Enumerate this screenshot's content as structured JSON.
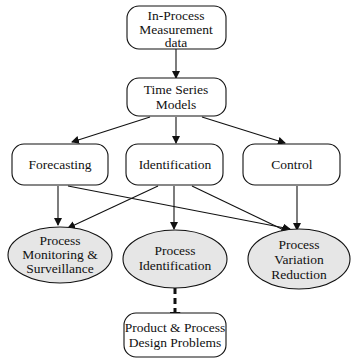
{
  "diagram": {
    "nodes": {
      "measurement": {
        "lines": [
          "In-Process",
          "Measurement",
          "data"
        ],
        "shape": "rounded-rect"
      },
      "tsmodels": {
        "lines": [
          "Time Series",
          "Models"
        ],
        "shape": "rounded-rect"
      },
      "forecasting": {
        "lines": [
          "Forecasting"
        ],
        "shape": "rounded-rect"
      },
      "identification": {
        "lines": [
          "Identification"
        ],
        "shape": "rounded-rect"
      },
      "control": {
        "lines": [
          "Control"
        ],
        "shape": "rounded-rect"
      },
      "monitoring": {
        "lines": [
          "Process",
          "Monitoring &",
          "Surveillance"
        ],
        "shape": "ellipse"
      },
      "procident": {
        "lines": [
          "Process",
          "Identification"
        ],
        "shape": "ellipse"
      },
      "variation": {
        "lines": [
          "Process",
          "Variation",
          "Reduction"
        ],
        "shape": "ellipse"
      },
      "design": {
        "lines": [
          "Product & Process",
          "Design Problems"
        ],
        "shape": "rounded-rect"
      }
    },
    "edges": [
      {
        "from": "measurement",
        "to": "tsmodels",
        "style": "solid"
      },
      {
        "from": "tsmodels",
        "to": "forecasting",
        "style": "solid"
      },
      {
        "from": "tsmodels",
        "to": "identification",
        "style": "solid"
      },
      {
        "from": "tsmodels",
        "to": "control",
        "style": "solid"
      },
      {
        "from": "forecasting",
        "to": "monitoring",
        "style": "solid"
      },
      {
        "from": "forecasting",
        "to": "variation",
        "style": "solid"
      },
      {
        "from": "identification",
        "to": "monitoring",
        "style": "solid"
      },
      {
        "from": "identification",
        "to": "procident",
        "style": "solid"
      },
      {
        "from": "identification",
        "to": "variation",
        "style": "solid"
      },
      {
        "from": "control",
        "to": "variation",
        "style": "solid"
      },
      {
        "from": "procident",
        "to": "design",
        "style": "dashed-bold"
      }
    ],
    "colors": {
      "stroke": "#111111",
      "ellipse_fill": "#e6e6e6",
      "box_fill": "#ffffff"
    }
  }
}
